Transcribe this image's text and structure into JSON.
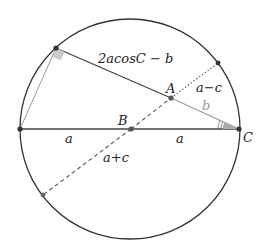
{
  "diagram": {
    "title": "",
    "circle": {
      "cx": 130,
      "cy": 129,
      "r": 110
    },
    "points": {
      "A": {
        "label": "A",
        "x": 171,
        "y": 98
      },
      "B": {
        "label": "B",
        "x": 131,
        "y": 129
      },
      "C": {
        "label": "C",
        "x": 239,
        "y": 129
      },
      "P": {
        "x": 56,
        "y": 48
      },
      "L": {
        "x": 20,
        "y": 129
      },
      "Q": {
        "x": 218,
        "y": 63
      },
      "R": {
        "x": 43,
        "y": 195
      }
    },
    "labels": {
      "segment_PA": "2acosC − b",
      "segment_AC": "b",
      "segment_AQ": "a−c",
      "segment_LB": "a",
      "segment_BC": "a",
      "segment_BR": "a+c",
      "point_A": "A",
      "point_B": "B",
      "point_C": "C"
    },
    "colors": {
      "stroke": "#333333",
      "light_stroke": "#999999",
      "angle_fill": "#aaaaaa",
      "right_angle_fill": "#cccccc"
    }
  }
}
